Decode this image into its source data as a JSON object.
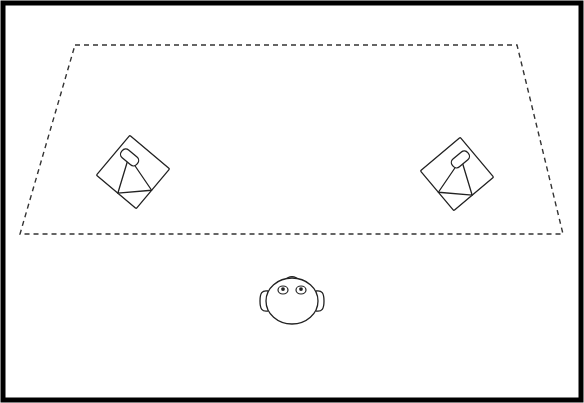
{
  "figure": {
    "background_color": "#ffffff",
    "line_color": "#222222",
    "frame": {
      "name": "outer-frame",
      "stroke": "#000000",
      "stroke_width": 5,
      "x": 3,
      "y": 3,
      "width": 578,
      "height": 397
    },
    "boundary": {
      "name": "listening-area-trapezoid",
      "shape": "trapezoid",
      "stroke": "#333333",
      "stroke_width": 1.4,
      "dash_pattern": "5 4",
      "points": [
        {
          "label": "top-left",
          "x": 75,
          "y": 45
        },
        {
          "label": "top-right",
          "x": 517,
          "y": 45
        },
        {
          "label": "bottom-right",
          "x": 563,
          "y": 234
        },
        {
          "label": "bottom-left",
          "x": 20,
          "y": 234
        }
      ]
    },
    "speakers": [
      {
        "name": "speaker-left",
        "label": "Left Loudspeaker",
        "center_x": 133,
        "center_y": 172,
        "cabinet_size": 52,
        "rotation_deg": 40,
        "mirrored": false
      },
      {
        "name": "speaker-right",
        "label": "Right Loudspeaker",
        "center_x": 457,
        "center_y": 174,
        "cabinet_size": 52,
        "rotation_deg": -40,
        "mirrored": true
      }
    ],
    "listener": {
      "name": "listener-head",
      "label": "Listener",
      "center_x": 292,
      "center_y": 301,
      "head_radius_x": 26,
      "head_radius_y": 23,
      "eyes": [
        {
          "name": "eye-left",
          "cx": 283,
          "cy": 290,
          "rx": 5,
          "ry": 4
        },
        {
          "name": "eye-right",
          "cx": 301,
          "cy": 290,
          "rx": 5,
          "ry": 4
        }
      ],
      "ears": [
        {
          "name": "ear-left",
          "cx": 265,
          "cy": 301
        },
        {
          "name": "ear-right",
          "cx": 319,
          "cy": 301
        }
      ],
      "nose_bump": {
        "name": "nose-bump",
        "cx": 292,
        "cy": 278,
        "rx": 6,
        "ry": 4
      }
    }
  }
}
